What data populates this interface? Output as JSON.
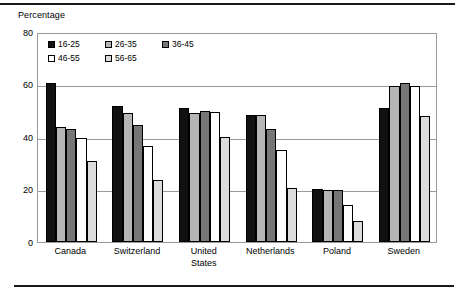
{
  "chart_data": {
    "type": "bar",
    "title": "",
    "subtitle": "",
    "xlabel": "",
    "ylabel": "Percentage",
    "ylim": [
      0,
      80
    ],
    "yticks": [
      0,
      20,
      40,
      60,
      80
    ],
    "grid": true,
    "legend_position": "top-left inside plot",
    "categories": [
      "Canada",
      "Switzerland",
      "United\nStates",
      "Netherlands",
      "Poland",
      "Sweden"
    ],
    "series": [
      {
        "name": "16-25",
        "color": "#111111",
        "values": [
          60.5,
          52.0,
          51.0,
          48.5,
          20.3,
          51.0
        ]
      },
      {
        "name": "26-35",
        "color": "#b5b5b5",
        "values": [
          44.0,
          49.0,
          49.0,
          48.5,
          20.0,
          59.5
        ]
      },
      {
        "name": "36-45",
        "color": "#767676",
        "values": [
          43.0,
          44.5,
          50.0,
          43.0,
          19.7,
          60.5
        ]
      },
      {
        "name": "46-55",
        "color": "#ffffff",
        "values": [
          39.5,
          36.5,
          49.5,
          35.0,
          14.0,
          59.5
        ]
      },
      {
        "name": "56-65",
        "color": "#dcdcdc",
        "values": [
          31.0,
          23.5,
          40.0,
          20.5,
          8.0,
          48.0
        ]
      }
    ]
  },
  "axis": {
    "y_title": "Percentage",
    "y_tick_labels": [
      "80",
      "60",
      "40",
      "20",
      "0"
    ]
  },
  "legend": {
    "items": [
      {
        "label": "16-25",
        "color": "#111111"
      },
      {
        "label": "26-35",
        "color": "#b5b5b5"
      },
      {
        "label": "36-45",
        "color": "#767676"
      },
      {
        "label": "46-55",
        "color": "#ffffff"
      },
      {
        "label": "56-65",
        "color": "#dcdcdc"
      }
    ]
  },
  "colors": {
    "frame": "#9a9a9a",
    "grid": "#9a9a9a",
    "rule": "#1a1a1a",
    "background": "#ffffff",
    "text": "#000000"
  }
}
